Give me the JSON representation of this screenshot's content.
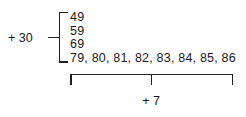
{
  "figure": {
    "type": "grouped-number-list-diagram",
    "background_color": "#ffffff",
    "ink_color": "#1f1f1f",
    "text_color": "#1a1a1a"
  },
  "rows": [
    {
      "text": "49"
    },
    {
      "text": "59"
    },
    {
      "text": "69"
    },
    {
      "text": "79, 80, 81, 82, 83, 84, 85, 86"
    }
  ],
  "labels": {
    "left_group": "+ 30",
    "bottom_group": "+ 7"
  },
  "braces": {
    "left": {
      "orientation": "vertical",
      "shape": "square-bracket",
      "spans_rows": "49-79"
    },
    "bottom": {
      "orientation": "horizontal",
      "shape": "square-bracket",
      "spans": "79-86"
    }
  }
}
